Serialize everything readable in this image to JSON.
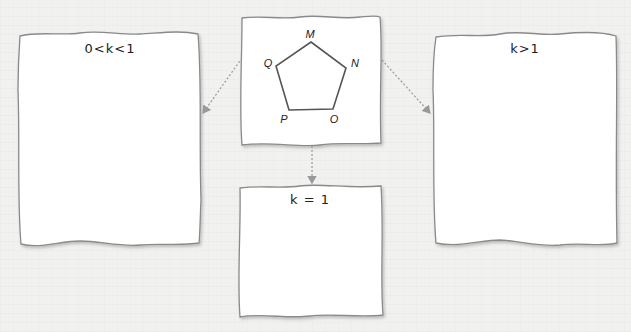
{
  "diagram": {
    "source_box": {
      "shape": "pentagon",
      "vertices": [
        "M",
        "N",
        "O",
        "P",
        "Q"
      ]
    },
    "boxes": [
      {
        "id": "left",
        "label": "0<k<1"
      },
      {
        "id": "bottom",
        "label": "k = 1"
      },
      {
        "id": "right",
        "label": "k>1"
      }
    ],
    "arrows": [
      {
        "from": "source",
        "to": "left",
        "style": "dotted"
      },
      {
        "from": "source",
        "to": "bottom",
        "style": "dotted"
      },
      {
        "from": "source",
        "to": "right",
        "style": "dotted"
      }
    ],
    "colors": {
      "background": "#f1f1f0",
      "box_fill": "#ffffff",
      "box_stroke": "#8a8a8a",
      "arrow": "#9a9a9a",
      "pentagon": "#555555",
      "text": "#222222"
    }
  }
}
